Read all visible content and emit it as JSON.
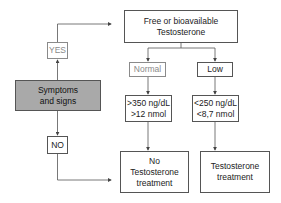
{
  "diagram": {
    "nodes": {
      "top": {
        "label": "Free or bioavailable Testosterone"
      },
      "yes": {
        "label": "YES"
      },
      "symptoms": {
        "label": "Symptoms and signs"
      },
      "no": {
        "label": "NO"
      },
      "normal": {
        "label": "Normal"
      },
      "low": {
        "label": "Low"
      },
      "normal_values": {
        "line1": ">350 ng/dL",
        "line2": ">12 nmol"
      },
      "low_values": {
        "line1": "<250 ng/dL",
        "line2": "<8,7 nmol"
      },
      "no_treatment": {
        "line1": "No",
        "line2": "Testosterone",
        "line3": "treatment"
      },
      "treatment": {
        "line1": "Testosterone",
        "line2": "treatment"
      }
    },
    "colors": {
      "filled_box": "#a9a9a9",
      "muted_text": "#8a8a8a",
      "line": "#555555"
    }
  }
}
